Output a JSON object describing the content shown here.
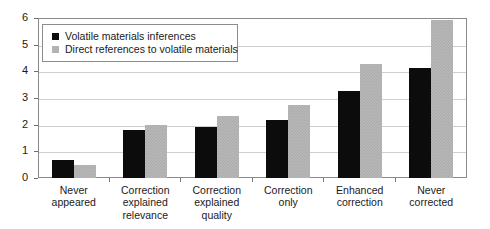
{
  "chart_data": {
    "type": "bar",
    "title": "",
    "subtitle": "",
    "xlabel": "",
    "ylabel": "",
    "ylim": [
      0,
      6
    ],
    "yticks": [
      0,
      1,
      2,
      3,
      4,
      5,
      6
    ],
    "ytick_labels": [
      "0",
      "1",
      "2",
      "3",
      "4",
      "5",
      "6"
    ],
    "grid": true,
    "grid_axis": "y",
    "legend_position": "upper-left-inside",
    "categories": [
      "Never\nappeared",
      "Correction\nexplained\nrelevance",
      "Correction\nexplained\nquality",
      "Correction\nonly",
      "Enhanced\ncorrection",
      "Never\ncorrected"
    ],
    "series": [
      {
        "name": "Volatile materials inferences",
        "color": "#0c0c0c",
        "values": [
          0.68,
          1.8,
          1.92,
          2.18,
          3.27,
          4.14
        ]
      },
      {
        "name": "Direct references to volatile materials",
        "color": "#b9b9b9",
        "values": [
          0.49,
          1.99,
          2.33,
          2.74,
          4.29,
          5.94
        ]
      }
    ]
  },
  "legend": {
    "items": [
      {
        "label": "Volatile materials inferences",
        "swatch": "series-a"
      },
      {
        "label": "Direct references to volatile materials",
        "swatch": "series-b"
      }
    ]
  },
  "colors": {
    "series_a": "#0c0c0c",
    "series_b": "#b9b9b9",
    "axis": "#8a8a8a",
    "gridline": "#cfcfcf",
    "background": "#ffffff",
    "text": "#1a1a1a"
  }
}
